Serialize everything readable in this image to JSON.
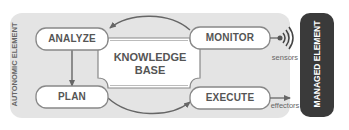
{
  "diagram": {
    "type": "MAPE-K autonomic control loop",
    "container": {
      "label": "AUTONOMIC ELEMENT",
      "fill": "#e6e6e6"
    },
    "nodes": {
      "analyze": "ANALYZE",
      "monitor": "MONITOR",
      "plan": "PLAN",
      "execute": "EXECUTE",
      "knowledge_line1": "KNOWLEDGE",
      "knowledge_line2": "BASE"
    },
    "external": {
      "managed_element": "MANAGED ELEMENT",
      "managed_fill": "#3a3a3a",
      "sensors": "sensors",
      "effectors": "effectors"
    },
    "edges": [
      {
        "from": "MONITOR",
        "to": "ANALYZE"
      },
      {
        "from": "ANALYZE",
        "to": "PLAN"
      },
      {
        "from": "PLAN",
        "to": "EXECUTE"
      },
      {
        "from": "sensors",
        "to": "MONITOR"
      },
      {
        "from": "EXECUTE",
        "to": "effectors"
      }
    ]
  }
}
